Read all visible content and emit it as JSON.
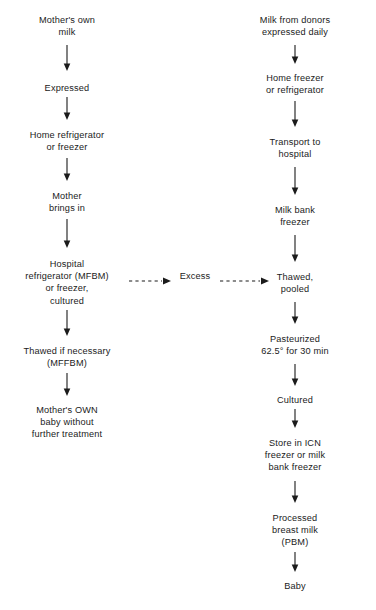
{
  "diagram": {
    "background_color": "#ffffff",
    "ink_color": "#1b1b1b",
    "columns": [
      {
        "id": "mothers-own-milk-path",
        "name": "Mother's own milk path",
        "center_x": 67,
        "nodes": [
          {
            "id": "mothers-own-milk",
            "label": "Mother's own\nmilk",
            "y": 14
          },
          {
            "id": "expressed",
            "label": "Expressed",
            "y": 82
          },
          {
            "id": "home-refrigerator-or-freezer",
            "label": "Home refrigerator\nor freezer",
            "y": 129
          },
          {
            "id": "mother-brings-in",
            "label": "Mother\nbrings in",
            "y": 190
          },
          {
            "id": "hospital-refrigerator",
            "label": "Hospital\nrefrigerator (MFBM)\nor freezer,\ncultured",
            "y": 258
          },
          {
            "id": "thawed-if-necessary",
            "label": "Thawed if necessary\n(MFFBM)",
            "y": 345
          },
          {
            "id": "mothers-own-baby",
            "label": "Mother's OWN\nbaby without\nfurther treatment",
            "y": 404
          }
        ],
        "arrows": [
          {
            "id": "arrow-milk-to-expressed",
            "x": 67,
            "y_start": 45,
            "y_end": 72
          },
          {
            "id": "arrow-expressed-to-home",
            "x": 67,
            "y_start": 97,
            "y_end": 120
          },
          {
            "id": "arrow-home-to-brings-in",
            "x": 67,
            "y_start": 158,
            "y_end": 181
          },
          {
            "id": "arrow-brings-in-to-hospital",
            "x": 67,
            "y_start": 219,
            "y_end": 248
          },
          {
            "id": "arrow-hospital-to-thawed",
            "x": 67,
            "y_start": 310,
            "y_end": 336
          },
          {
            "id": "arrow-thawed-to-own-baby",
            "x": 67,
            "y_start": 373,
            "y_end": 396
          }
        ]
      },
      {
        "id": "donor-milk-path",
        "name": "Donor milk bank path",
        "center_x": 295,
        "nodes": [
          {
            "id": "milk-from-donors",
            "label": "Milk from donors\nexpressed daily",
            "y": 14
          },
          {
            "id": "home-freezer-or-refrigerator",
            "label": "Home freezer\nor refrigerator",
            "y": 72
          },
          {
            "id": "transport-to-hospital",
            "label": "Transport to\nhospital",
            "y": 136
          },
          {
            "id": "milk-bank-freezer",
            "label": "Milk bank\nfreezer",
            "y": 204
          },
          {
            "id": "thawed-pooled",
            "label": "Thawed,\npooled",
            "y": 271
          },
          {
            "id": "pasteurized",
            "label": "Pasteurized\n62.5° for 30 min",
            "y": 333
          },
          {
            "id": "cultured",
            "label": "Cultured",
            "y": 394
          },
          {
            "id": "store-in-icn",
            "label": "Store in ICN\nfreezer or milk\nbank freezer",
            "y": 437
          },
          {
            "id": "processed-breast-milk",
            "label": "Processed\nbreast milk\n(PBM)",
            "y": 512
          },
          {
            "id": "baby",
            "label": "Baby",
            "y": 580
          }
        ],
        "arrows": [
          {
            "id": "arrow-donors-to-home-freezer",
            "x": 295,
            "y_start": 45,
            "y_end": 63
          },
          {
            "id": "arrow-home-freezer-to-transport",
            "x": 295,
            "y_start": 101,
            "y_end": 127
          },
          {
            "id": "arrow-transport-to-milk-bank",
            "x": 295,
            "y_start": 167,
            "y_end": 195
          },
          {
            "id": "arrow-milk-bank-to-thawed",
            "x": 295,
            "y_start": 235,
            "y_end": 262
          },
          {
            "id": "arrow-thawed-to-pasteurized",
            "x": 295,
            "y_start": 302,
            "y_end": 324
          },
          {
            "id": "arrow-pasteurized-to-cultured",
            "x": 295,
            "y_start": 364,
            "y_end": 386
          },
          {
            "id": "arrow-cultured-to-store",
            "x": 295,
            "y_start": 409,
            "y_end": 428
          },
          {
            "id": "arrow-store-to-pbm",
            "x": 295,
            "y_start": 481,
            "y_end": 503
          },
          {
            "id": "arrow-pbm-to-baby",
            "x": 295,
            "y_start": 552,
            "y_end": 572
          }
        ]
      }
    ],
    "cross_link": {
      "id": "excess-link",
      "label": "Excess",
      "label_x": 195,
      "label_y": 276,
      "style": "dashed",
      "segments": [
        {
          "id": "excess-arrow-in",
          "x_start": 129,
          "x_end": 170,
          "y": 281
        },
        {
          "id": "excess-arrow-out",
          "x_start": 220,
          "x_end": 268,
          "y": 281
        }
      ]
    }
  }
}
